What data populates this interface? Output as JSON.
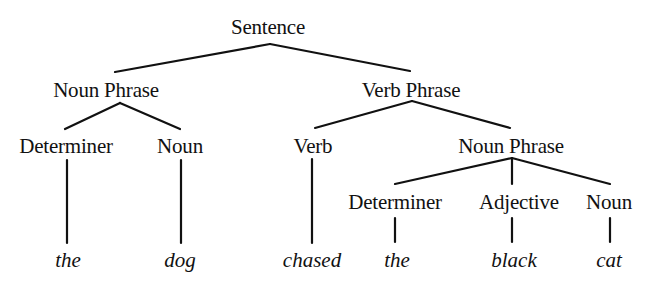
{
  "diagram": {
    "type": "syntax-tree",
    "root": {
      "label": "Sentence",
      "children": [
        {
          "label": "Noun Phrase",
          "children": [
            {
              "label": "Determiner",
              "word": "the"
            },
            {
              "label": "Noun",
              "word": "dog"
            }
          ]
        },
        {
          "label": "Verb Phrase",
          "children": [
            {
              "label": "Verb",
              "word": "chased"
            },
            {
              "label": "Noun Phrase",
              "children": [
                {
                  "label": "Determiner",
                  "word": "the"
                },
                {
                  "label": "Adjective",
                  "word": "black"
                },
                {
                  "label": "Noun",
                  "word": "cat"
                }
              ]
            }
          ]
        }
      ]
    },
    "nodes": {
      "sentence": "Sentence",
      "np1": "Noun Phrase",
      "vp": "Verb Phrase",
      "det1": "Determiner",
      "noun1": "Noun",
      "verb": "Verb",
      "np2": "Noun Phrase",
      "det2": "Determiner",
      "adj": "Adjective",
      "noun2": "Noun"
    },
    "words": {
      "w1": "the",
      "w2": "dog",
      "w3": "chased",
      "w4": "the",
      "w5": "black",
      "w6": "cat"
    },
    "colors": {
      "ink": "#111111",
      "background": "#ffffff"
    }
  }
}
